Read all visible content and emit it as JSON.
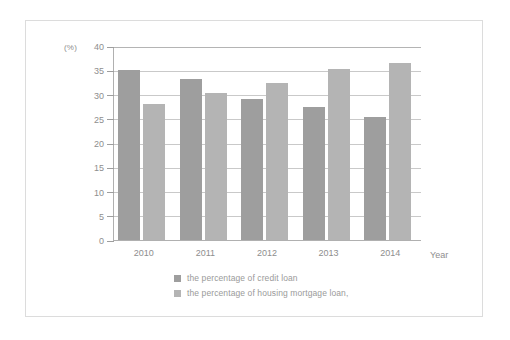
{
  "chart_data": {
    "type": "bar",
    "title": "",
    "xlabel": "Year",
    "ylabel": "(%)",
    "unit_label": "(%)",
    "categories": [
      "2010",
      "2011",
      "2012",
      "2013",
      "2014"
    ],
    "series": [
      {
        "name": "the percentage of credit loan",
        "color": "#9e9e9e",
        "values": [
          35.0,
          33.3,
          29.1,
          27.5,
          25.3
        ]
      },
      {
        "name": "the percentage of housing mortgage loan,",
        "color": "#b4b4b4",
        "values": [
          28.0,
          30.3,
          32.3,
          35.3,
          36.4
        ]
      }
    ],
    "ylim": [
      0,
      40
    ],
    "yticks": [
      0,
      5,
      10,
      15,
      20,
      25,
      30,
      35,
      40
    ],
    "ytick_labels": [
      "0",
      "5",
      "10",
      "15",
      "20",
      "25",
      "30",
      "35",
      "40"
    ],
    "grid": true,
    "legend_position": "bottom"
  },
  "legend": {
    "items": [
      {
        "label": "the percentage of credit loan"
      },
      {
        "label": "the percentage of housing mortgage loan,"
      }
    ]
  },
  "axes": {
    "x_title": "Year",
    "y_unit": "(%)"
  }
}
